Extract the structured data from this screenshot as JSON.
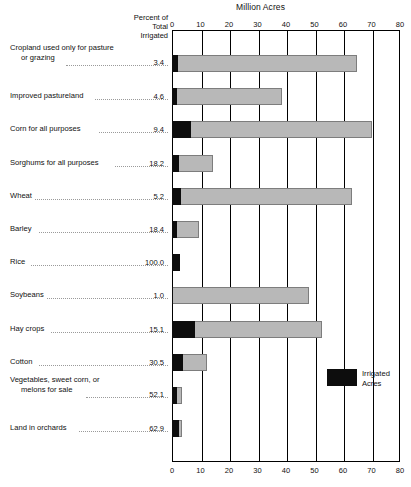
{
  "header": {
    "title": "Million Acres",
    "percent_col_line1": "Percent of",
    "percent_col_line2": "Total",
    "percent_col_line3": "Irrigated"
  },
  "legend": {
    "line1": "Irrigated",
    "line2": "Acres",
    "swatch_color": "#0d0d0d"
  },
  "colors": {
    "total_bar": "#b8b8b8",
    "irrigated_bar": "#0d0d0d",
    "axis": "#000000"
  },
  "chart_data": {
    "type": "bar",
    "title": "Million Acres",
    "xlabel": "Million Acres",
    "ylabel": "",
    "xlim": [
      0,
      80
    ],
    "xticks": [
      "0",
      "10",
      "20",
      "30",
      "40",
      "50",
      "60",
      "70",
      "80"
    ],
    "grid": true,
    "legend_position": "inside-right-lower",
    "orientation": "horizontal",
    "series": [
      {
        "name": "Irrigated Acres",
        "color": "#0d0d0d"
      },
      {
        "name": "Total Acres",
        "color": "#b8b8b8"
      }
    ],
    "categories": [
      "Cropland used only for pasture or grazing",
      "Improved pastureland",
      "Corn for all purposes",
      "Sorghums for all purposes",
      "Wheat",
      "Barley",
      "Rice",
      "Soybeans",
      "Hay crops",
      "Cotton",
      "Vegetables, sweet corn, or melons for sale",
      "Land in orchards"
    ],
    "rows": [
      {
        "label_line1": "Cropland used only for pasture",
        "label_line2": "or grazing",
        "percent": "3.4",
        "total": 65.0,
        "irrigated": 2.2
      },
      {
        "label_line1": "Improved pastureland",
        "label_line2": "",
        "percent": "4.6",
        "total": 38.5,
        "irrigated": 1.8
      },
      {
        "label_line1": "Corn for all purposes",
        "label_line2": "",
        "percent": "9.4",
        "total": 70.0,
        "irrigated": 6.6
      },
      {
        "label_line1": "Sorghums for all purposes",
        "label_line2": "",
        "percent": "18.2",
        "total": 14.3,
        "irrigated": 2.6
      },
      {
        "label_line1": "Wheat",
        "label_line2": "",
        "percent": "5.2",
        "total": 63.0,
        "irrigated": 3.3
      },
      {
        "label_line1": "Barley",
        "label_line2": "",
        "percent": "18.4",
        "total": 9.6,
        "irrigated": 1.8
      },
      {
        "label_line1": "Rice",
        "label_line2": "",
        "percent": "100.0",
        "total": 2.9,
        "irrigated": 2.9
      },
      {
        "label_line1": "Soybeans",
        "label_line2": "",
        "percent": "1.0",
        "total": 48.0,
        "irrigated": 0.5
      },
      {
        "label_line1": "Hay crops",
        "label_line2": "",
        "percent": "15.1",
        "total": 52.5,
        "irrigated": 7.9
      },
      {
        "label_line1": "Cotton",
        "label_line2": "",
        "percent": "30.5",
        "total": 12.2,
        "irrigated": 3.7
      },
      {
        "label_line1": "Vegetables, sweet corn, or",
        "label_line2": "melons for sale",
        "percent": "52.1",
        "total": 3.4,
        "irrigated": 1.8
      },
      {
        "label_line1": "Land in orchards",
        "label_line2": "",
        "percent": "62.9",
        "total": 3.6,
        "irrigated": 2.3
      }
    ]
  }
}
